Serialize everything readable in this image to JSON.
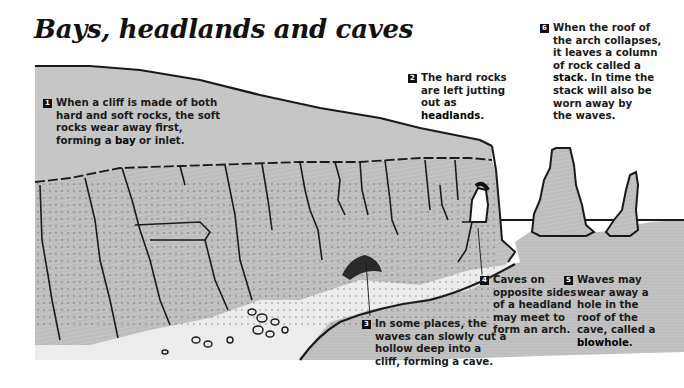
{
  "title": "Bays, headlands and caves",
  "colors": {
    "land": "#c4c4c4",
    "cliff": "#b8b8b8",
    "sea": "#bdbdbd",
    "beach": "#ececec",
    "ink": "#1a1a1a",
    "background": "#ffffff"
  },
  "callouts": [
    {
      "number": "1",
      "lines": [
        "When a cliff is made of both",
        "hard and soft rocks, the soft",
        "rocks wear away first,"
      ],
      "last_line_pre": "forming a ",
      "last_line_bold": "bay",
      "last_line_post": " or inlet."
    },
    {
      "number": "2",
      "lines": [
        "The hard rocks",
        "are left jutting",
        "out as"
      ],
      "last_line_pre": "",
      "last_line_bold": "headlands",
      "last_line_post": "."
    },
    {
      "number": "3",
      "lines": [
        "In some places, the",
        "waves can slowly cut a",
        "hollow deep into a",
        "cliff, forming a cave."
      ],
      "last_line_pre": "",
      "last_line_bold": "",
      "last_line_post": ""
    },
    {
      "number": "4",
      "lines": [
        "Caves on",
        "opposite sides",
        "of a headland",
        "may meet to",
        "form an arch."
      ],
      "last_line_pre": "",
      "last_line_bold": "",
      "last_line_post": ""
    },
    {
      "number": "5",
      "lines": [
        "Waves may",
        "wear away a",
        "hole in the",
        "roof of the",
        "cave, called a"
      ],
      "last_line_pre": "",
      "last_line_bold": "blowhole",
      "last_line_post": "."
    },
    {
      "number": "6",
      "lines": [
        "When the roof of",
        "the arch collapses,",
        "it leaves a column",
        "of rock called a"
      ],
      "stack_pre": "",
      "stack_bold": "stack",
      "stack_post": ". In time the",
      "after_lines": [
        "stack will also be",
        "worn away by",
        "the waves."
      ]
    }
  ]
}
